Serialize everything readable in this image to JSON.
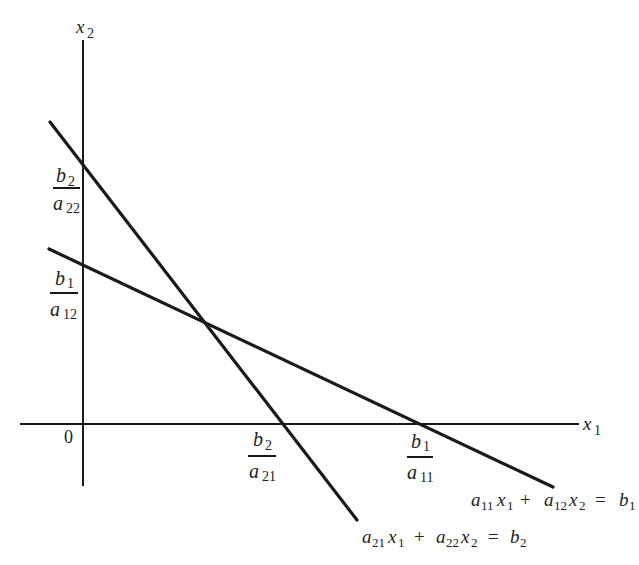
{
  "diagram": {
    "type": "two-line linear system graph",
    "axes": {
      "x_label": "x",
      "x_sub": "1",
      "y_label": "x",
      "y_sub": "2",
      "origin_label": "0"
    },
    "intercepts": {
      "line2_y": {
        "num": "b",
        "num_sub": "2",
        "den": "a",
        "den_sub": "22"
      },
      "line1_y": {
        "num": "b",
        "num_sub": "1",
        "den": "a",
        "den_sub": "12"
      },
      "line2_x": {
        "num": "b",
        "num_sub": "2",
        "den": "a",
        "den_sub": "21"
      },
      "line1_x": {
        "num": "b",
        "num_sub": "1",
        "den": "a",
        "den_sub": "11"
      }
    },
    "equations": {
      "line1": {
        "a1": "a",
        "a1_sub": "11",
        "x1": "x",
        "x1_sub": "1",
        "plus": "+",
        "a2": "a",
        "a2_sub": "12",
        "x2": "x",
        "x2_sub": "2",
        "eq": "=",
        "b": "b",
        "b_sub": "1"
      },
      "line2": {
        "a1": "a",
        "a1_sub": "21",
        "x1": "x",
        "x1_sub": "1",
        "plus": "+",
        "a2": "a",
        "a2_sub": "22",
        "x2": "x",
        "x2_sub": "2",
        "eq": "=",
        "b": "b",
        "b_sub": "2"
      }
    },
    "colors": {
      "stroke": "#1a1a1a",
      "background": "#ffffff"
    }
  }
}
